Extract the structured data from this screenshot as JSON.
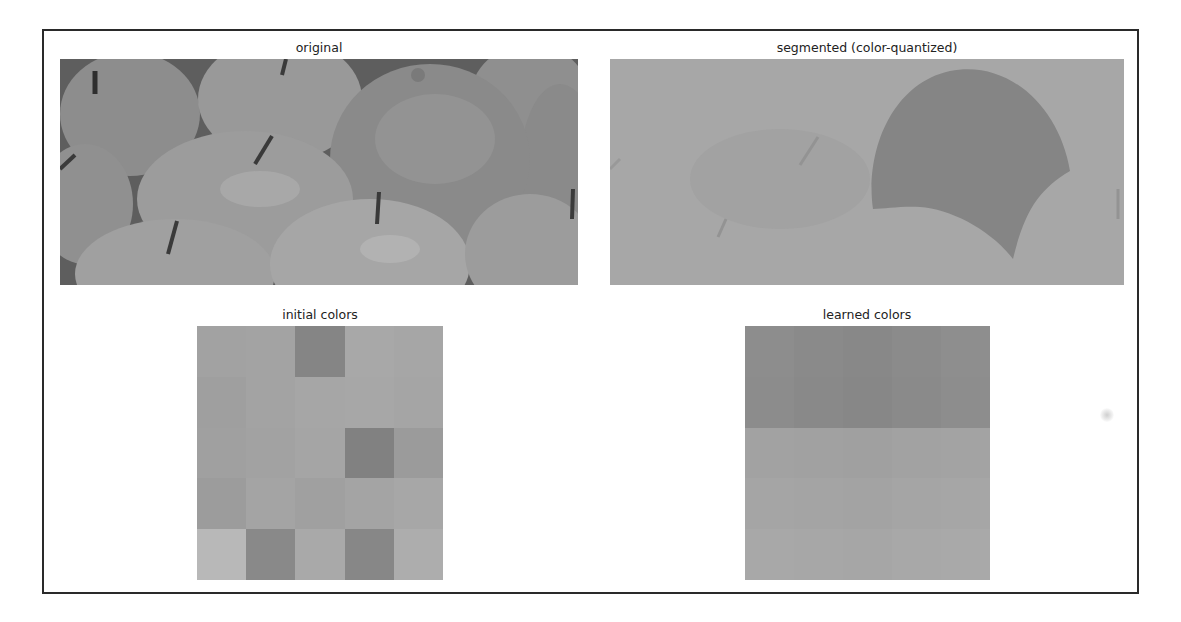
{
  "figure": {
    "panels": {
      "original": {
        "title": "original"
      },
      "segmented": {
        "title": "segmented (color-quantized)"
      },
      "initial": {
        "title": "initial colors"
      },
      "learned": {
        "title": "learned colors"
      }
    }
  },
  "chart_data": [
    {
      "type": "image",
      "title": "original",
      "description": "Grayscale photo of a pile of apples with one orange (upper center-right)",
      "extent_px": [
        60,
        59,
        578,
        285
      ]
    },
    {
      "type": "image",
      "title": "segmented (color-quantized)",
      "description": "Color-quantized version: apples flattened to a single light gray tone, orange region a darker uniform tone",
      "extent_px": [
        610,
        59,
        1124,
        285
      ],
      "tones": {
        "apples": "#a6a6a6",
        "orange": "#858585"
      }
    },
    {
      "type": "heatmap",
      "title": "initial colors",
      "grid": [
        5,
        5
      ],
      "extent_px": [
        197,
        326,
        443,
        580
      ],
      "colors": [
        [
          "#a2a2a2",
          "#a3a3a3",
          "#858585",
          "#a8a8a8",
          "#a6a6a6"
        ],
        [
          "#9f9f9f",
          "#a3a3a3",
          "#a6a6a6",
          "#a7a7a7",
          "#a5a5a5"
        ],
        [
          "#a0a0a0",
          "#a2a2a2",
          "#a5a5a5",
          "#818181",
          "#9b9b9b"
        ],
        [
          "#9c9c9c",
          "#a4a4a4",
          "#a0a0a0",
          "#a4a4a4",
          "#a7a7a7"
        ],
        [
          "#b8b8b8",
          "#898989",
          "#a9a9a9",
          "#878787",
          "#adadad"
        ]
      ]
    },
    {
      "type": "heatmap",
      "title": "learned colors",
      "grid": [
        5,
        5
      ],
      "extent_px": [
        745,
        326,
        990,
        580
      ],
      "colors": [
        [
          "#8d8d8d",
          "#8a8a8a",
          "#888888",
          "#8b8b8b",
          "#8e8e8e"
        ],
        [
          "#8c8c8c",
          "#898989",
          "#878787",
          "#8a8a8a",
          "#8d8d8d"
        ],
        [
          "#a2a2a2",
          "#a1a1a1",
          "#a0a0a0",
          "#a2a2a2",
          "#a3a3a3"
        ],
        [
          "#a5a5a5",
          "#a4a4a4",
          "#a3a3a3",
          "#a5a5a5",
          "#a6a6a6"
        ],
        [
          "#a8a8a8",
          "#a7a7a7",
          "#a6a6a6",
          "#a8a8a8",
          "#a9a9a9"
        ]
      ]
    }
  ]
}
